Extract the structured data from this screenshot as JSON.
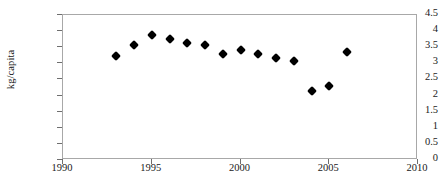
{
  "chart_data": {
    "type": "scatter",
    "title": "",
    "subtitle": "",
    "xlabel": "",
    "ylabel": "kg/capita",
    "xlim": [
      1990,
      2010
    ],
    "ylim": [
      0,
      4.5
    ],
    "grid": false,
    "legend": false,
    "legend_position": "none",
    "x_tick_labels": [
      "1990",
      "1995",
      "2000",
      "2005",
      "2010"
    ],
    "x_tick_values": [
      1990,
      1995,
      2000,
      2005,
      2010
    ],
    "y_tick_labels": [
      "0",
      "0.5",
      "1",
      "1.5",
      "2",
      "2.5",
      "3",
      "3.5",
      "4",
      "4.5"
    ],
    "y_tick_values": [
      0,
      0.5,
      1,
      1.5,
      2,
      2.5,
      3,
      3.5,
      4,
      4.5
    ],
    "marker_shape": "diamond",
    "marker_color": "#000000",
    "x": [
      1993,
      1994,
      1995,
      1996,
      1997,
      1998,
      1999,
      2000,
      2001,
      2002,
      2003,
      2004,
      2005,
      2006
    ],
    "values": [
      3.22,
      3.57,
      3.87,
      3.76,
      3.62,
      3.57,
      3.28,
      3.42,
      3.28,
      3.17,
      3.06,
      2.14,
      2.3,
      3.36
    ],
    "points": [
      {
        "x": 1993,
        "y": 3.22
      },
      {
        "x": 1994,
        "y": 3.57
      },
      {
        "x": 1995,
        "y": 3.87
      },
      {
        "x": 1996,
        "y": 3.76
      },
      {
        "x": 1997,
        "y": 3.62
      },
      {
        "x": 1998,
        "y": 3.57
      },
      {
        "x": 1999,
        "y": 3.28
      },
      {
        "x": 2000,
        "y": 3.42
      },
      {
        "x": 2001,
        "y": 3.28
      },
      {
        "x": 2002,
        "y": 3.17
      },
      {
        "x": 2003,
        "y": 3.06
      },
      {
        "x": 2004,
        "y": 2.14
      },
      {
        "x": 2005,
        "y": 2.3
      },
      {
        "x": 2006,
        "y": 3.36
      }
    ]
  },
  "colors": {
    "marker": "#000000",
    "frame": "#a8a8a8",
    "tick": "#6e6e6e",
    "text": "#1a1a1a",
    "background": "#ffffff"
  }
}
